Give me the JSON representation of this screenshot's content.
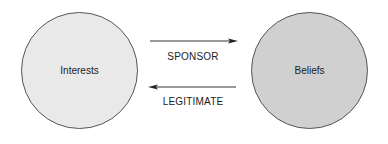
{
  "nodes": [
    {
      "id": "interests",
      "label": "Interests",
      "fill": "#e9e9e9"
    },
    {
      "id": "beliefs",
      "label": "Beliefs",
      "fill": "#d0d0d0"
    }
  ],
  "edges": [
    {
      "from": "interests",
      "to": "beliefs",
      "label": "SPONSOR"
    },
    {
      "from": "beliefs",
      "to": "interests",
      "label": "LEGITIMATE"
    }
  ],
  "colors": {
    "outline": "#555555",
    "arrow": "#333333"
  }
}
